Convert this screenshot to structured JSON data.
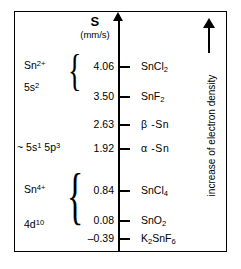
{
  "chart_data": {
    "type": "scatter",
    "title": "S",
    "subtitle": "(mm/s)",
    "ylabel": "S (mm/s)",
    "xlabel": "",
    "axis_unit": "(mm/s)",
    "orientation": "vertical-axis",
    "grid": false,
    "legend_position": "none",
    "ylim": [
      -0.39,
      4.06
    ],
    "categories": [
      "SnCl2",
      "SnF2",
      "beta-Sn",
      "alpha-Sn",
      "SnCl4",
      "SnO2",
      "K2SnF6"
    ],
    "values": [
      4.06,
      3.5,
      2.63,
      1.92,
      0.84,
      0.08,
      -0.39
    ],
    "annotations": [
      "increase of electron density"
    ],
    "levels": [
      {
        "value": "4.06",
        "numeric": 4.06,
        "species_html": "SnCl<sub>2</sub>",
        "species_text": "SnCl2"
      },
      {
        "value": "3.50",
        "numeric": 3.5,
        "species_html": "SnF<sub>2</sub>",
        "species_text": "SnF2"
      },
      {
        "value": "2.63",
        "numeric": 2.63,
        "species_html": "β -Sn",
        "species_text": "beta-Sn"
      },
      {
        "value": "1.92",
        "numeric": 1.92,
        "species_html": "α -Sn",
        "species_text": "alpha-Sn"
      },
      {
        "value": "0.84",
        "numeric": 0.84,
        "species_html": "SnCl<sub>4</sub>",
        "species_text": "SnCl4"
      },
      {
        "value": "0.08",
        "numeric": 0.08,
        "species_html": "SnO<sub>2</sub>",
        "species_text": "SnO2"
      },
      {
        "value": "–0.39",
        "numeric": -0.39,
        "species_html": "K<sub>2</sub>SnF<sub>6</sub>",
        "species_text": "K2SnF6"
      }
    ],
    "groups": [
      {
        "name": "tin-two-plus",
        "label_html": "Sn<sup>2+</sup>",
        "label_text": "Sn2+",
        "config_html": "5s<sup>2</sup>",
        "config_text": "5s2",
        "covers": [
          "SnCl2",
          "SnF2"
        ]
      },
      {
        "name": "intermediate",
        "label_html": "~ 5s<sup>1</sup> 5p<sup>3</sup>",
        "label_text": "~ 5s1 5p3",
        "config_html": "",
        "config_text": "",
        "covers": [
          "alpha-Sn"
        ]
      },
      {
        "name": "tin-four-plus",
        "label_html": "Sn<sup>4+</sup>",
        "label_text": "Sn4+",
        "config_html": "4d<sup>10</sup>",
        "config_text": "4d10",
        "covers": [
          "SnCl4",
          "SnO2",
          "K2SnF6"
        ]
      }
    ]
  },
  "axis": {
    "title": "S",
    "unit": "(mm/s)"
  },
  "annotation": {
    "text": "increase of electron density",
    "arrow_direction": "up"
  },
  "brace": {
    "glyph": "{"
  },
  "colors": {
    "ink": "#000000",
    "background": "#ffffff"
  }
}
